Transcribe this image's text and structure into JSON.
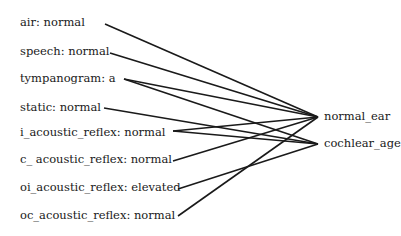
{
  "inputs": [
    {
      "label": "air: normal",
      "x": 20,
      "y": 15,
      "end": [
        105,
        24
      ]
    },
    {
      "label": "speech: normal",
      "x": 20,
      "y": 44,
      "end": [
        110,
        53
      ]
    },
    {
      "label": "tympanogram: a",
      "x": 20,
      "y": 71,
      "end": [
        124,
        79
      ]
    },
    {
      "label": "static: normal",
      "x": 20,
      "y": 100,
      "end": [
        104,
        108
      ]
    },
    {
      "label": "i_acoustic_reflex: normal",
      "x": 20,
      "y": 125,
      "end": [
        173,
        131
      ]
    },
    {
      "label": "c_ acoustic_reflex: normal",
      "x": 20,
      "y": 152,
      "end": [
        173,
        161
      ]
    },
    {
      "label": "oi_acoustic_reflex: elevated",
      "x": 20,
      "y": 180,
      "end": [
        178,
        189
      ]
    },
    {
      "label": "oc_acoustic_reflex: normal",
      "x": 20,
      "y": 208,
      "end": [
        178,
        216
      ]
    }
  ],
  "outputs": [
    {
      "label": "normal_ear",
      "x": 324,
      "y": 109,
      "end": [
        318,
        117
      ]
    },
    {
      "label": "cochlear_age",
      "x": 324,
      "y": 136,
      "end": [
        318,
        144
      ]
    }
  ],
  "edges": [
    [
      0,
      0
    ],
    [
      1,
      0
    ],
    [
      2,
      0
    ],
    [
      2,
      1
    ],
    [
      3,
      1
    ],
    [
      4,
      0
    ],
    [
      4,
      1
    ],
    [
      5,
      0
    ],
    [
      6,
      1
    ],
    [
      7,
      0
    ]
  ],
  "colors": {
    "line": "#1a1a1a",
    "text": "#1a1a1a"
  }
}
